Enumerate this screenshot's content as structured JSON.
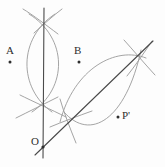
{
  "figure": {
    "kind": "compass-and-straightedge-construction",
    "background_color": "#fdfdfd",
    "width": 165,
    "height": 167,
    "label_color": "#2e2e2e",
    "line_color": "#4a4a4a",
    "arc_color": "#9a9a9a",
    "dot_color": "#2e2e2e"
  },
  "labels": {
    "a": "A",
    "b": "B",
    "o": "O",
    "p_prime": "P'"
  },
  "points": [
    {
      "name": "A",
      "label": "A",
      "x": 10,
      "y": 62,
      "dot": true
    },
    {
      "name": "B",
      "label": "B",
      "x": 79,
      "y": 62,
      "dot": true
    },
    {
      "name": "P'",
      "label": "P'",
      "x": 118,
      "y": 117,
      "dot": true
    },
    {
      "name": "O",
      "label": "O",
      "x": 44,
      "y": 148,
      "dot": true
    }
  ],
  "intersections": [
    {
      "name": "left-lens-top",
      "x": 42,
      "y": 20
    },
    {
      "name": "left-lens-bottom",
      "x": 42,
      "y": 104
    },
    {
      "name": "right-lens-upper",
      "x": 135,
      "y": 55
    },
    {
      "name": "right-lens-lower",
      "x": 68,
      "y": 118
    }
  ],
  "lines": [
    {
      "name": "vertical-line",
      "role": "perpendicular-bisector",
      "x1": 44,
      "y1": 8,
      "x2": 43,
      "y2": 158,
      "color": "#4a4a4a",
      "width": 1.1
    },
    {
      "name": "diagonal-line",
      "role": "angle-bisector",
      "x1": 35,
      "y1": 155,
      "x2": 153,
      "y2": 41,
      "color": "#4a4a4a",
      "width": 1.1
    }
  ],
  "arcs": [
    {
      "name": "left-arc-west",
      "d": "M 55 14 C 18 38, 18 88, 52 112",
      "color": "#9a9a9a"
    },
    {
      "name": "left-arc-east",
      "d": "M 29 14 C 68 38, 68 88, 32 112",
      "color": "#9a9a9a"
    },
    {
      "name": "right-arc-upper",
      "d": "M 58 124 C 76 66, 118 44, 147 60",
      "color": "#9a9a9a"
    },
    {
      "name": "right-arc-lower",
      "d": "M 62 110 C 86 140, 124 122, 142 48",
      "color": "#9a9a9a"
    },
    {
      "name": "left-crossing-arc-top",
      "d": "M 25 10 C 36 16, 50 26, 62 36",
      "color": "#9a9a9a"
    },
    {
      "name": "left-crossing-arc-bottom",
      "d": "M 18 116 C 32 110, 54 98, 66 92",
      "color": "#9a9a9a"
    },
    {
      "name": "right-crossing-arc",
      "d": "M 122 42 C 134 52, 146 64, 156 74",
      "color": "#9a9a9a"
    },
    {
      "name": "lower-crossing-arc",
      "d": "M 60 100 C 66 114, 72 128, 78 142",
      "color": "#9a9a9a"
    }
  ]
}
